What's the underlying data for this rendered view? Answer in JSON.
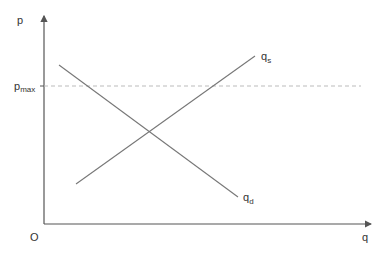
{
  "diagram": {
    "title": "",
    "type": "supply-demand with price ceiling",
    "axes": {
      "y_label": "p",
      "x_label": "q",
      "origin_label": "O"
    },
    "price_ceiling": {
      "label_main": "p",
      "label_sub": "max",
      "style": "dashed"
    },
    "curves": [
      {
        "name": "supply",
        "label_main": "q",
        "label_sub": "s"
      },
      {
        "name": "demand",
        "label_main": "q",
        "label_sub": "d"
      }
    ],
    "colors": {
      "axis": "#555555",
      "curve": "#777777",
      "dashed": "#bbbbbb",
      "text": "#333333"
    }
  }
}
